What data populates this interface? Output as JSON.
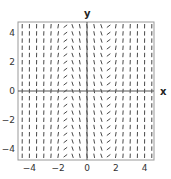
{
  "chart_data": {
    "type": "slope_field",
    "title": "",
    "xlabel": "x",
    "ylabel": "y",
    "xlim": [
      -4.75,
      4.75
    ],
    "ylim": [
      -4.75,
      4.75
    ],
    "xticks": [
      -4,
      -2,
      0,
      2,
      4
    ],
    "yticks": [
      -4,
      -2,
      0,
      2,
      4
    ],
    "xtick_labels": [
      "−4",
      "−2",
      "0",
      "2",
      "4"
    ],
    "ytick_labels": [
      "−4",
      "−2",
      "0",
      "2",
      "4"
    ],
    "grid": false,
    "grid_step": 0.5,
    "grid_range": [
      -4.5,
      4.5
    ],
    "slope_description": "Slope depends on x only; segments are near-vertical except near x ≈ ±1.4 where they are horizontal",
    "slope_model": "dy/dx ≈ 3(x^2 - 2)",
    "colors": {
      "segment": "#333333",
      "axis": "#555555",
      "frame": "#999999"
    }
  }
}
